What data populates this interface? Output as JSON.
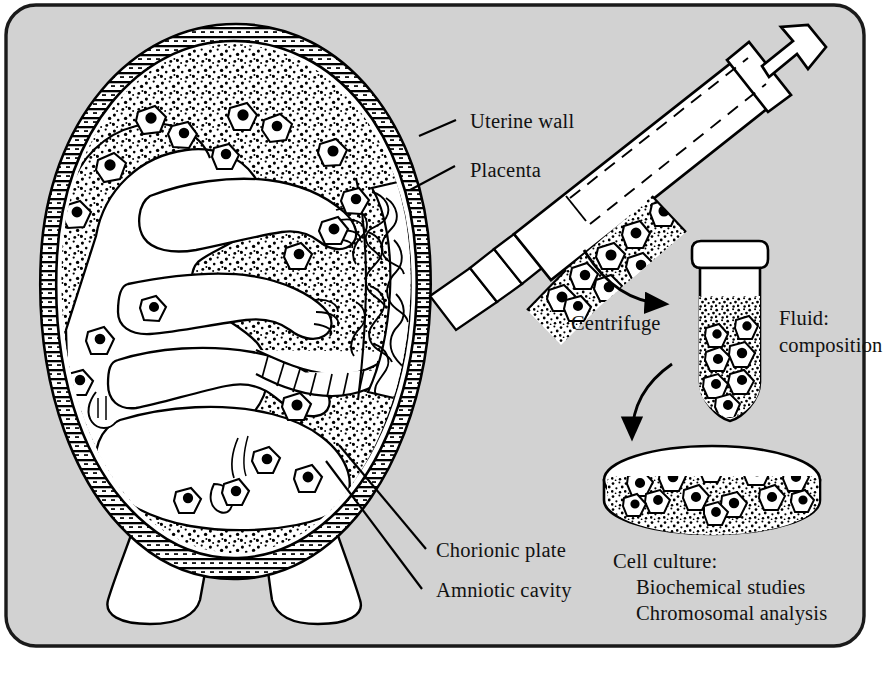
{
  "figure": {
    "frame": {
      "background_color": "#d2d2d2",
      "border_color": "#000000",
      "outside_color": "#ffffff"
    },
    "ink_color": "#000000",
    "fill_color": "#ffffff"
  },
  "labels": {
    "uterine_wall": "Uterine wall",
    "placenta": "Placenta",
    "chorionic_plate": "Chorionic plate",
    "amniotic_cavity": "Amniotic cavity",
    "centrifuge": "Centrifuge",
    "fluid_line1": "Fluid:",
    "fluid_line2": "composition",
    "cell_culture_line1": "Cell culture:",
    "cell_culture_line2": "Biochemical studies",
    "cell_culture_line3": "Chromosomal analysis"
  },
  "parts": {
    "uterus": "uterus-cross-section",
    "fetus": "fetus",
    "placenta": "placenta",
    "amniotic_fluid": "amniotic-fluid-stipple",
    "fetal_cells": "fetal-cells",
    "syringe": "syringe",
    "needle": "needle",
    "centrifuge_tube": "centrifuge-tube",
    "petri_dish": "petri-dish",
    "arrow_to_tube": "arrow-syringe-to-tube",
    "arrow_to_dish": "arrow-tube-to-dish"
  },
  "counts": {
    "cells_in_amniotic_cavity": 14,
    "cells_in_syringe": 8,
    "cells_in_tube_pellet": 7,
    "cells_in_dish": 12
  }
}
